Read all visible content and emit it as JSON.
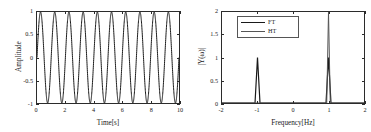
{
  "figure": {
    "background": "#ffffff",
    "panel_count": 2
  },
  "chart_data": [
    {
      "id": "time-domain",
      "type": "line",
      "title": "",
      "xlabel": "Time[s]",
      "ylabel": "Amplitude",
      "xlim": [
        0,
        10
      ],
      "ylim": [
        -1,
        1
      ],
      "xticks": [
        0,
        2,
        4,
        6,
        8,
        10
      ],
      "xticklabels": [
        "0",
        "2",
        "4",
        "6",
        "8",
        "10"
      ],
      "yticks": [
        -1,
        -0.5,
        0,
        0.5,
        1
      ],
      "yticklabels": [
        "-1",
        "-0.5",
        "0",
        "0.5",
        "1"
      ],
      "grid": false,
      "legend": null,
      "series": [
        {
          "name": "signal",
          "color": "#1a1a1a",
          "linewidth": 1.0,
          "description": "sine wave, amplitude 1, frequency 1 Hz, 10 cycles over 10 s",
          "equation": "y(t) = sin(2*pi*1*t)",
          "amplitude": 1,
          "frequency_hz": 1,
          "phase": 0,
          "cycles": 10
        }
      ]
    },
    {
      "id": "frequency-domain",
      "type": "line",
      "title": "",
      "xlabel": "Frequency[Hz]",
      "ylabel": "|Y(ω)|",
      "xlim": [
        -2,
        2
      ],
      "ylim": [
        0,
        2
      ],
      "xticks": [
        -2,
        -1,
        0,
        1,
        2
      ],
      "xticklabels": [
        "-2",
        "-1",
        "0",
        "1",
        "2"
      ],
      "yticks": [
        0,
        0.5,
        1,
        1.5,
        2
      ],
      "yticklabels": [
        "0",
        "0.5",
        "1",
        "1.5",
        "2"
      ],
      "grid": false,
      "legend": {
        "position": "upper left",
        "entries": [
          {
            "label": "FT",
            "color": "#1a1a1a",
            "linewidth": 1.2
          },
          {
            "label": "HT",
            "color": "#555555",
            "linewidth": 1.0
          }
        ]
      },
      "series": [
        {
          "name": "FT",
          "color": "#1a1a1a",
          "linewidth": 1.2,
          "description": "Fourier transform magnitude: two spikes of height 1 at -1 Hz and +1 Hz",
          "peaks": [
            {
              "x": -1,
              "y": 1
            },
            {
              "x": 1,
              "y": 1
            }
          ],
          "peak_halfwidth_hz": 0.07
        },
        {
          "name": "HT",
          "color": "#555555",
          "linewidth": 1.0,
          "description": "Hilbert transform magnitude: single spike of height 2 at +1 Hz, zero at -1 Hz",
          "peaks": [
            {
              "x": 1,
              "y": 2
            }
          ],
          "peak_halfwidth_hz": 0.05
        }
      ]
    }
  ]
}
